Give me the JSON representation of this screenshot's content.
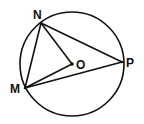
{
  "diagram": {
    "type": "circle-geometry",
    "stroke_color": "#111111",
    "background": "#ffffff",
    "circle": {
      "center_label": "O",
      "cx": 72,
      "cy": 64,
      "r": 52
    },
    "points": [
      {
        "id": "N",
        "label": "N",
        "x": 41,
        "y": 23,
        "label_x": 33,
        "label_y": 19
      },
      {
        "id": "M",
        "label": "M",
        "x": 25,
        "y": 88,
        "label_x": 10,
        "label_y": 93
      },
      {
        "id": "P",
        "label": "P",
        "x": 122,
        "y": 62,
        "label_x": 126,
        "label_y": 67
      },
      {
        "id": "O",
        "label": "O",
        "x": 72,
        "y": 64,
        "label_x": 76,
        "label_y": 69
      }
    ],
    "segments": [
      [
        "N",
        "M"
      ],
      [
        "N",
        "P"
      ],
      [
        "M",
        "P"
      ],
      [
        "N",
        "O"
      ],
      [
        "M",
        "O"
      ]
    ]
  }
}
